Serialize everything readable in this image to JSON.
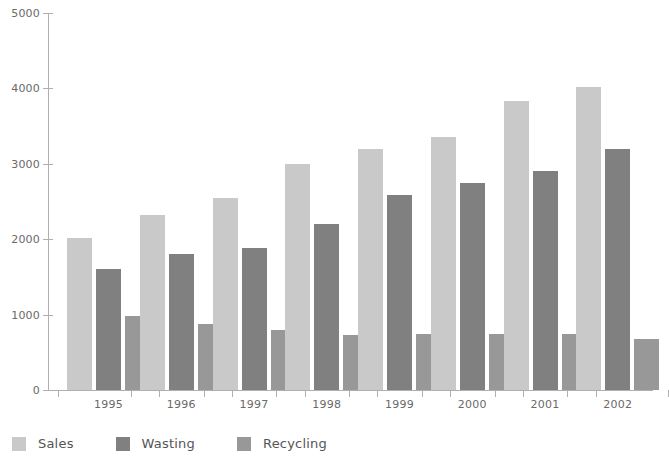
{
  "chart_data": {
    "type": "bar",
    "title": "",
    "xlabel": "",
    "ylabel": "",
    "categories": [
      "1995",
      "1996",
      "1997",
      "1998",
      "1999",
      "2000",
      "2001",
      "2002"
    ],
    "series": [
      {
        "name": "Sales",
        "color": "#c9c9c9",
        "values": [
          2020,
          2320,
          2550,
          3000,
          3200,
          3360,
          3830,
          4020
        ]
      },
      {
        "name": "Wasting",
        "color": "#808080",
        "values": [
          1610,
          1800,
          1880,
          2200,
          2580,
          2750,
          2900,
          3190
        ]
      },
      {
        "name": "Recycling",
        "color": "#989898",
        "values": [
          980,
          880,
          790,
          730,
          740,
          740,
          740,
          680
        ]
      }
    ],
    "ylim": [
      0,
      5000
    ],
    "ytick_labels": [
      "0",
      "1000",
      "2000",
      "3000",
      "4000",
      "5000"
    ],
    "ytick_values": [
      0,
      1000,
      2000,
      3000,
      4000,
      5000
    ],
    "grid": false,
    "legend_position": "bottom-left",
    "axis_color": "#b0b0b0",
    "background_color": "#ffffff",
    "text_color": "#6a6a6a"
  },
  "legend": {
    "items": [
      {
        "label": "Sales"
      },
      {
        "label": "Wasting"
      },
      {
        "label": "Recycling"
      }
    ]
  }
}
